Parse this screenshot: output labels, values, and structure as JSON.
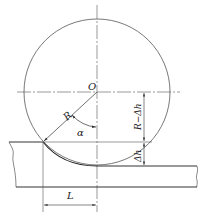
{
  "diagram": {
    "type": "rolling contact geometry",
    "colors": {
      "line": "#333333",
      "background": "#ffffff"
    },
    "labels": {
      "center": "O",
      "radius": "R",
      "angle": "α",
      "height_minus": "R−Δh",
      "delta_h": "Δh",
      "contact_length": "L"
    },
    "geometry": {
      "center": [
        97,
        92
      ],
      "radius": 73,
      "entry_surface_y": 142,
      "exit_surface_y": 166,
      "bottom_y": 187,
      "contact_point": [
        43,
        142
      ]
    }
  }
}
